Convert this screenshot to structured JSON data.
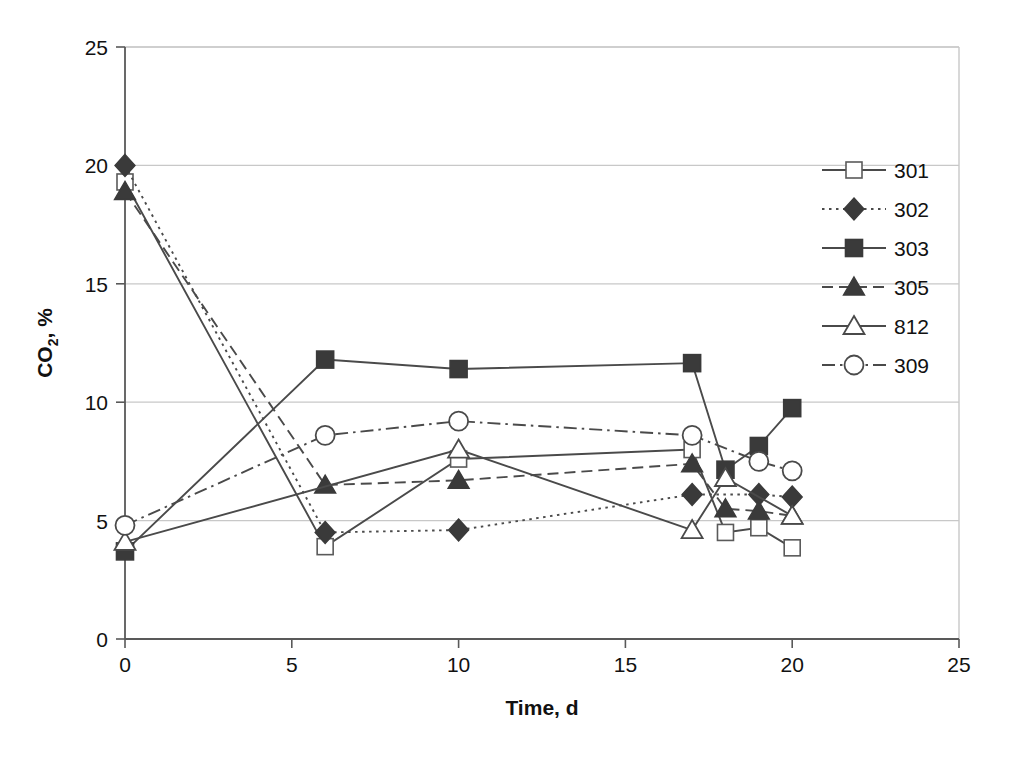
{
  "figure": {
    "background": "#ffffff",
    "axis_color": "#595959",
    "grid_color": "#c8c8c8",
    "marker_fill_dark": "#3a3a3a"
  },
  "chart_data": {
    "type": "line",
    "title": "",
    "xlabel": "Time, d",
    "ylabel_main": "CO",
    "ylabel_sub": "2",
    "ylabel_tail": ", %",
    "ylabel": "CO2, %",
    "xlim": [
      0,
      25
    ],
    "ylim": [
      0,
      25
    ],
    "xticks": [
      0,
      5,
      10,
      15,
      20,
      25
    ],
    "yticks": [
      0,
      5,
      10,
      15,
      20,
      25
    ],
    "xtick_labels": [
      "0",
      "5",
      "10",
      "15",
      "20",
      "25"
    ],
    "ytick_labels": [
      "0",
      "5",
      "10",
      "15",
      "20",
      "25"
    ],
    "grid": "horizontal",
    "legend_position": "top-right-inside",
    "series": [
      {
        "name": "301",
        "marker": "open-square",
        "line": "solid",
        "x": [
          0,
          6,
          10,
          17,
          18,
          19,
          20
        ],
        "y": [
          19.3,
          3.9,
          7.6,
          8.0,
          4.5,
          4.7,
          3.85
        ]
      },
      {
        "name": "302",
        "marker": "filled-diamond",
        "line": "dotted",
        "x": [
          0,
          6,
          10,
          17,
          19,
          20
        ],
        "y": [
          20.0,
          4.5,
          4.6,
          6.1,
          6.1,
          6.0
        ]
      },
      {
        "name": "303",
        "marker": "filled-square",
        "line": "solid",
        "x": [
          0,
          6,
          10,
          17,
          18,
          19,
          20
        ],
        "y": [
          3.7,
          11.8,
          11.4,
          11.65,
          7.15,
          8.15,
          9.75
        ]
      },
      {
        "name": "305",
        "marker": "filled-triangle",
        "line": "dashed",
        "x": [
          0,
          6,
          10,
          17,
          18,
          19,
          20
        ],
        "y": [
          18.9,
          6.5,
          6.7,
          7.4,
          5.5,
          5.4,
          5.2
        ]
      },
      {
        "name": "812",
        "marker": "open-triangle",
        "line": "solid",
        "x": [
          0,
          10,
          17,
          18,
          20
        ],
        "y": [
          4.1,
          8.0,
          4.6,
          6.8,
          5.2
        ]
      },
      {
        "name": "309",
        "marker": "open-circle",
        "line": "dash-dot",
        "x": [
          0,
          6,
          10,
          17,
          19,
          20
        ],
        "y": [
          4.8,
          8.6,
          9.2,
          8.6,
          7.5,
          7.1
        ]
      }
    ]
  },
  "legend": {
    "items": [
      {
        "label": "301",
        "marker": "open-square",
        "line": "solid"
      },
      {
        "label": "302",
        "marker": "filled-diamond",
        "line": "dotted"
      },
      {
        "label": "303",
        "marker": "filled-square",
        "line": "solid"
      },
      {
        "label": "305",
        "marker": "filled-triangle",
        "line": "dashed"
      },
      {
        "label": "812",
        "marker": "open-triangle",
        "line": "solid"
      },
      {
        "label": "309",
        "marker": "open-circle",
        "line": "dash-dot"
      }
    ]
  }
}
